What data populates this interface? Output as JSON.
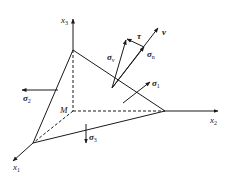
{
  "diagram": {
    "colors": {
      "line": "#1a1a1a",
      "background": "#ffffff"
    },
    "axes": {
      "x1": {
        "symbol": "x",
        "sub": "1"
      },
      "x2": {
        "symbol": "x",
        "sub": "2"
      },
      "x3": {
        "symbol": "x",
        "sub": "3"
      }
    },
    "origin_label": "M",
    "stresses": {
      "sigma1": {
        "symbol": "σ",
        "sub": "1"
      },
      "sigma2": {
        "symbol": "σ",
        "sub": "2"
      },
      "sigma3": {
        "symbol": "σ",
        "sub": "3"
      },
      "sigma_nu": {
        "symbol": "σ",
        "sub": "ν"
      },
      "sigma_n": {
        "symbol": "σ",
        "sub": "n"
      },
      "tau": {
        "symbol": "τ"
      },
      "normal": {
        "symbol": "ν"
      }
    }
  }
}
